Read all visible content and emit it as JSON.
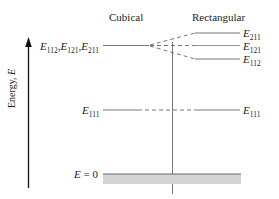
{
  "headings": {
    "cubical": "Cubical",
    "rectangular": "Rectangular"
  },
  "axis": {
    "label": "Energy, E",
    "label_main": "Energy, ",
    "label_var": "E"
  },
  "levels": {
    "cubical_degenerate": {
      "label_parts": [
        {
          "letter": "E",
          "sub": "112"
        },
        {
          "letter": "E",
          "sub": "121"
        },
        {
          "letter": "E",
          "sub": "211"
        }
      ],
      "label": "E112,E121,E211"
    },
    "rectangular_split": [
      {
        "letter": "E",
        "sub": "211",
        "label": "E211"
      },
      {
        "letter": "E",
        "sub": "121",
        "label": "E121"
      },
      {
        "letter": "E",
        "sub": "112",
        "label": "E112"
      }
    ],
    "ground_left": {
      "letter": "E",
      "sub": "111",
      "label": "E111"
    },
    "ground_right": {
      "letter": "E",
      "sub": "111",
      "label": "E111"
    },
    "zero": {
      "label": "E = 0",
      "letter": "E",
      "rest": " = 0"
    }
  },
  "colors": {
    "line": "#777777",
    "dashed": "#666666",
    "band": "#d4d4d4",
    "band_edge": "#666666",
    "arrow": "#111111",
    "divider": "#555555"
  }
}
